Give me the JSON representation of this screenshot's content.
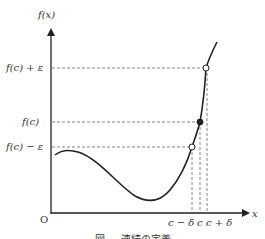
{
  "diagram": {
    "y_axis_label": "f(x)",
    "x_axis_label": "x",
    "origin_label": "O",
    "y_ticks": {
      "upper": "f(c) + ε",
      "middle": "f(c)",
      "lower": "f(c) − ε"
    },
    "x_ticks": {
      "left": "c − δ",
      "middle": "c",
      "right": "c + δ"
    },
    "points": [
      {
        "name": "f(c)+ε point",
        "style": "open"
      },
      {
        "name": "f(c) point",
        "style": "filled"
      },
      {
        "name": "f(c)-ε point",
        "style": "open"
      }
    ],
    "caption": "図 — 連続の定義",
    "colors": {
      "line": "#222222",
      "dashed": "#666666",
      "text": "#333333"
    }
  }
}
